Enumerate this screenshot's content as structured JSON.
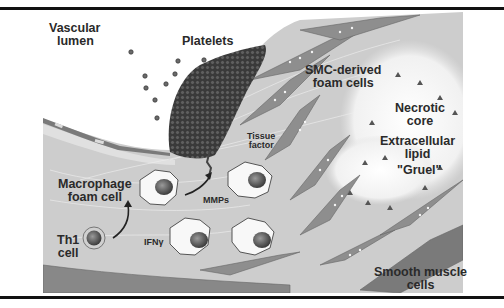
{
  "figure": {
    "labels": {
      "vascular_lumen": [
        "Vascular",
        "lumen"
      ],
      "platelets": "Platelets",
      "smc_foam_cells": [
        "SMC-derived",
        "foam cells"
      ],
      "necrotic_core": [
        "Necrotic",
        "core"
      ],
      "extracellular_lipid": [
        "Extracellular",
        "lipid"
      ],
      "gruel": "\"Gruel\"",
      "tissue_factor": [
        "Tissue",
        "factor"
      ],
      "macrophage_foam_cell": [
        "Macrophage",
        "foam cell"
      ],
      "mmps": "MMPs",
      "th1_cell": [
        "Th1",
        "cell"
      ],
      "ifn_gamma": "IFNγ",
      "smooth_muscle_cells": [
        "Smooth muscle",
        "cells"
      ]
    },
    "colors": {
      "background": "#ffffff",
      "rule": "#111111",
      "intima": "#c9c9c9",
      "intima_light": "#d8d8d8",
      "platelet": "#4a4a4a",
      "smc_cell": "#8c8c8c",
      "smc_dark": "#6e6e6e",
      "necrotic_core": "#efefef",
      "text": "#2a2a2a",
      "nucleus": "#555555"
    }
  },
  "caption_fragment": "...cut off caption text below figure..."
}
